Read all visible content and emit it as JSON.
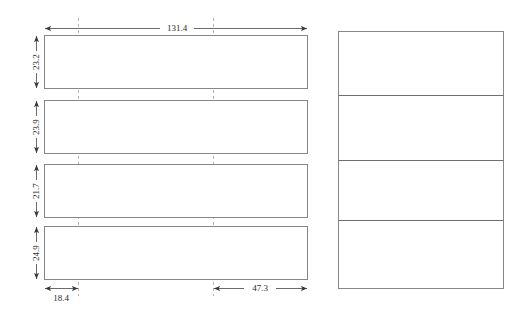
{
  "diagram": {
    "type": "engineering-dimension-drawing",
    "background_color": "#ffffff",
    "outline_color": "#878787",
    "guide_color": "#b4b4b4",
    "dimension_color": "#5a5a5a",
    "text_color": "#2a2a2a",
    "left_group": {
      "name": "left-panel-stack",
      "description": "four separated horizontal rectangles",
      "count": 4,
      "panels": [
        {
          "id": "left-panel-1",
          "height_label": "23.2"
        },
        {
          "id": "left-panel-2",
          "height_label": "23.9"
        },
        {
          "id": "left-panel-3",
          "height_label": "21.7"
        },
        {
          "id": "left-panel-4",
          "height_label": "24.9"
        }
      ]
    },
    "right_group": {
      "name": "right-panel-stack",
      "description": "four contiguous stacked rectangles sharing edges",
      "count": 4,
      "panels": [
        {
          "id": "right-panel-1"
        },
        {
          "id": "right-panel-2"
        },
        {
          "id": "right-panel-3"
        },
        {
          "id": "right-panel-4"
        }
      ]
    },
    "dimensions": {
      "overall_width": {
        "label": "131.4",
        "orientation": "horizontal",
        "position": "top",
        "arrows": "both"
      },
      "heights": [
        {
          "label": "23.2",
          "orientation": "vertical",
          "arrows": "both",
          "panel": "left-panel-1"
        },
        {
          "label": "23.9",
          "orientation": "vertical",
          "arrows": "both",
          "panel": "left-panel-2"
        },
        {
          "label": "21.7",
          "orientation": "vertical",
          "arrows": "both",
          "panel": "left-panel-3"
        },
        {
          "label": "24.9",
          "orientation": "vertical",
          "arrows": "both",
          "panel": "left-panel-4"
        }
      ],
      "bottom_left_offset": {
        "label": "18.4",
        "orientation": "horizontal",
        "position": "bottom-left",
        "arrows": "both"
      },
      "bottom_right_offset": {
        "label": "47.3",
        "orientation": "horizontal",
        "position": "bottom-right",
        "arrows": "both"
      }
    },
    "guides": [
      {
        "id": "guide-line-1",
        "orientation": "vertical",
        "style": "dashed"
      },
      {
        "id": "guide-line-2",
        "orientation": "vertical",
        "style": "dashed"
      }
    ]
  }
}
